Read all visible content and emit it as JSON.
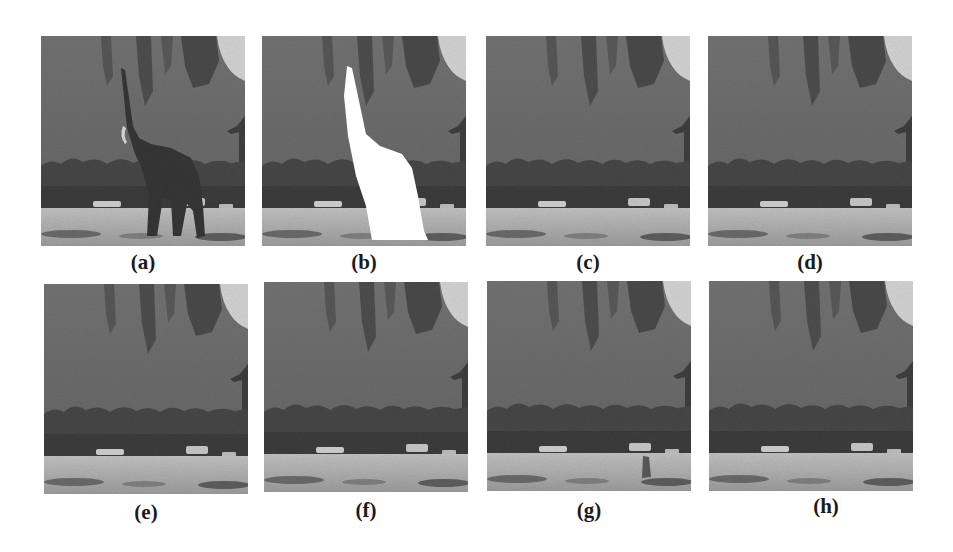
{
  "figure": {
    "panels": [
      {
        "id": "a",
        "label": "(a)",
        "content": "original-image-with-elephant"
      },
      {
        "id": "b",
        "label": "(b)",
        "content": "mask-white-region-over-elephant"
      },
      {
        "id": "c",
        "label": "(c)",
        "content": "inpainted-result"
      },
      {
        "id": "d",
        "label": "(d)",
        "content": "inpainted-result"
      },
      {
        "id": "e",
        "label": "(e)",
        "content": "inpainted-result"
      },
      {
        "id": "f",
        "label": "(f)",
        "content": "inpainted-result"
      },
      {
        "id": "g",
        "label": "(g)",
        "content": "inpainted-result-with-small-artifact"
      },
      {
        "id": "h",
        "label": "(h)",
        "content": "inpainted-result"
      }
    ],
    "colors": {
      "sky_highlight": "#d8d8d8",
      "hillside": "#6f6f6f",
      "foliage_dark": "#4a4a4a",
      "treeline": "#3e3e3e",
      "ground": "#b4b4b4",
      "shadow": "#5a5a5a",
      "elephant": "#383838",
      "mask": "#ffffff"
    }
  }
}
